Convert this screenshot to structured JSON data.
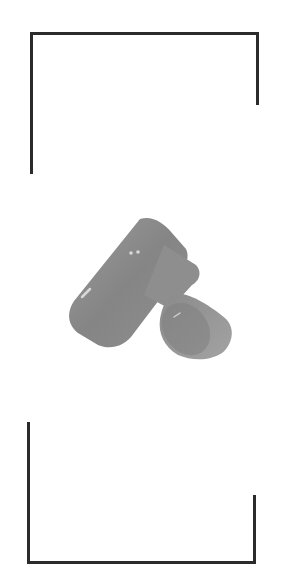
{
  "viewfinder": {
    "frame_color": "#2b2b2b",
    "background_color": "#ffffff"
  },
  "subject": {
    "icon": "camera-object",
    "description": "Grayscale camera body with lens, shown tilted in viewfinder",
    "colors": {
      "body": "#8c8c8c",
      "body_dark": "#7a7a7a",
      "lens": "#9a9a9a",
      "highlight": "#d8d8d8"
    }
  }
}
